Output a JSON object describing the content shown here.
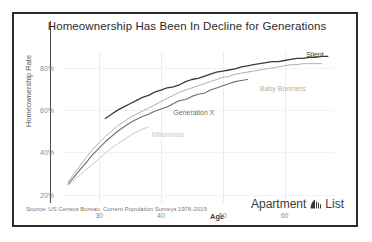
{
  "title": "Homeownership Has Been In Decline for Generations",
  "source": "Source: US Census Bureau, Current Population Surveys 1976-2019",
  "logo": {
    "word1": "Apartment",
    "word2": "List",
    "mark": "apartment-list-mark-icon"
  },
  "chart_data": {
    "type": "line",
    "title": "Homeownership Has Been In Decline for Generations",
    "xlabel": "Age",
    "ylabel": "Homeownership Rate",
    "xlim": [
      24,
      68
    ],
    "ylim": [
      16,
      88
    ],
    "xticks": [
      30,
      40,
      50,
      60
    ],
    "xticklabels": [
      "30",
      "40",
      "50",
      "60"
    ],
    "yticks": [
      20,
      40,
      60,
      80
    ],
    "yticklabels": [
      "20%",
      "40%",
      "60%",
      "80%"
    ],
    "grid": true,
    "legend_position": "inline-end-of-line",
    "series": [
      {
        "name": "Millennials",
        "color": "#c9c9c9",
        "label_x": 38.5,
        "label_y": 48.0,
        "x": [
          25,
          26,
          27,
          28,
          29,
          30,
          31,
          32,
          33,
          34,
          35,
          36,
          37,
          38
        ],
        "y": [
          24.5,
          27.0,
          29.5,
          32.0,
          34.5,
          37.0,
          39.5,
          42.0,
          44.0,
          46.0,
          48.0,
          49.5,
          51.0,
          52.0
        ]
      },
      {
        "name": "Generation X",
        "color": "#6f6f6f",
        "label_x": 42.0,
        "label_y": 58.5,
        "x": [
          25,
          26,
          27,
          28,
          29,
          30,
          31,
          32,
          33,
          34,
          35,
          36,
          37,
          38,
          39,
          40,
          41,
          42,
          43,
          44,
          45,
          46,
          47,
          48,
          49,
          50,
          51,
          52,
          53,
          54
        ],
        "y": [
          25.0,
          28.5,
          32.0,
          35.5,
          39.0,
          42.0,
          45.0,
          47.5,
          50.0,
          52.0,
          54.0,
          55.5,
          57.0,
          58.0,
          59.5,
          60.5,
          61.5,
          63.0,
          64.5,
          65.0,
          66.5,
          67.5,
          68.0,
          69.5,
          70.5,
          71.5,
          72.5,
          73.5,
          74.0,
          74.5
        ]
      },
      {
        "name": "Baby Boomers",
        "color": "#b0b0b0",
        "label_x": 56.0,
        "label_y": 70.0,
        "x": [
          25,
          26,
          27,
          28,
          29,
          30,
          31,
          32,
          33,
          34,
          35,
          36,
          37,
          38,
          39,
          40,
          41,
          42,
          43,
          44,
          45,
          46,
          47,
          48,
          49,
          50,
          51,
          52,
          53,
          54,
          55,
          56,
          57,
          58,
          59,
          60,
          61,
          62,
          63,
          64,
          65,
          66
        ],
        "y": [
          26.0,
          30.0,
          34.0,
          38.0,
          41.5,
          44.5,
          47.5,
          50.0,
          52.5,
          54.5,
          56.5,
          58.0,
          59.5,
          61.0,
          62.5,
          64.0,
          65.5,
          67.0,
          68.5,
          69.5,
          70.5,
          71.5,
          72.5,
          73.5,
          74.5,
          75.5,
          76.0,
          77.0,
          77.5,
          78.0,
          78.5,
          79.0,
          79.5,
          80.0,
          80.5,
          81.0,
          81.5,
          81.5,
          82.0,
          82.0,
          82.0,
          82.0
        ]
      },
      {
        "name": "Silent",
        "color": "#3b3b3b",
        "label_x": 63.5,
        "label_y": 86.0,
        "x": [
          31,
          32,
          33,
          34,
          35,
          36,
          37,
          38,
          39,
          40,
          41,
          42,
          43,
          44,
          45,
          46,
          47,
          48,
          49,
          50,
          51,
          52,
          53,
          54,
          55,
          56,
          57,
          58,
          59,
          60,
          61,
          62,
          63,
          64,
          65,
          66,
          67
        ],
        "y": [
          56.0,
          58.0,
          60.0,
          61.5,
          63.0,
          64.5,
          66.0,
          67.0,
          68.5,
          69.5,
          70.5,
          71.0,
          72.0,
          73.5,
          74.5,
          75.0,
          76.0,
          77.0,
          78.0,
          78.5,
          79.0,
          79.5,
          80.5,
          81.0,
          81.5,
          82.0,
          82.5,
          83.0,
          83.0,
          83.5,
          84.0,
          84.5,
          84.5,
          85.0,
          85.0,
          85.5,
          85.5
        ]
      }
    ]
  }
}
